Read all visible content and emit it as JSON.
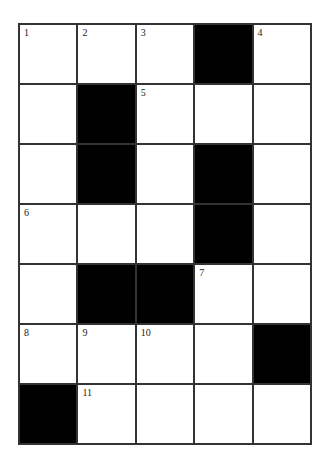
{
  "puzzle": {
    "rows": 7,
    "cols": 5,
    "grid": [
      [
        {
          "n": "1"
        },
        {
          "n": "2"
        },
        {
          "n": "3"
        },
        {
          "b": true
        },
        {
          "n": "4"
        }
      ],
      [
        {},
        {
          "b": true
        },
        {
          "n": "5"
        },
        {},
        {}
      ],
      [
        {},
        {
          "b": true
        },
        {},
        {
          "b": true
        },
        {}
      ],
      [
        {
          "n": "6"
        },
        {},
        {},
        {
          "b": true
        },
        {}
      ],
      [
        {},
        {
          "b": true
        },
        {
          "b": true
        },
        {
          "n": "7"
        },
        {}
      ],
      [
        {
          "n": "8"
        },
        {
          "n": "9"
        },
        {
          "n": "10"
        },
        {},
        {
          "b": true
        }
      ],
      [
        {
          "b": true
        },
        {
          "n": "11"
        },
        {},
        {},
        {}
      ]
    ],
    "colors": {
      "black": "#000000",
      "white": "#ffffff",
      "line": "#333333"
    }
  }
}
